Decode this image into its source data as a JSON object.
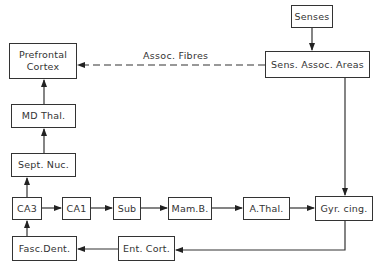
{
  "diagram": {
    "nodes": {
      "senses": "Senses",
      "sens_assoc_areas": "Sens. Assoc. Areas",
      "prefrontal_cortex": "Prefrontal\nCortex",
      "md_thal": "MD Thal.",
      "sept_nuc": "Sept. Nuc.",
      "ca3": "CA3",
      "ca1": "CA1",
      "sub": "Sub",
      "mam_b": "Mam.B.",
      "a_thal": "A.Thal.",
      "gyr_cing": "Gyr. cing.",
      "ent_cort": "Ent. Cort.",
      "fasc_dent": "Fasc.Dent."
    },
    "edge_labels": {
      "assoc_fibres": "Assoc. Fibres"
    },
    "edges": [
      {
        "from": "Senses",
        "to": "Sens. Assoc. Areas",
        "style": "solid"
      },
      {
        "from": "Sens. Assoc. Areas",
        "to": "Prefrontal Cortex",
        "style": "dashed",
        "label": "Assoc. Fibres"
      },
      {
        "from": "Sens. Assoc. Areas",
        "to": "Gyr. cing.",
        "style": "solid"
      },
      {
        "from": "MD Thal.",
        "to": "Prefrontal Cortex",
        "style": "solid"
      },
      {
        "from": "Sept. Nuc.",
        "to": "MD Thal.",
        "style": "solid"
      },
      {
        "from": "CA3",
        "to": "Sept. Nuc.",
        "style": "solid"
      },
      {
        "from": "CA3",
        "to": "CA1",
        "style": "solid"
      },
      {
        "from": "CA1",
        "to": "Sub",
        "style": "solid"
      },
      {
        "from": "Sub",
        "to": "Mam.B.",
        "style": "solid"
      },
      {
        "from": "Mam.B.",
        "to": "A.Thal.",
        "style": "solid"
      },
      {
        "from": "A.Thal.",
        "to": "Gyr. cing.",
        "style": "solid"
      },
      {
        "from": "Gyr. cing.",
        "to": "Ent. Cort.",
        "style": "solid"
      },
      {
        "from": "Ent. Cort.",
        "to": "Fasc.Dent.",
        "style": "solid"
      },
      {
        "from": "Fasc.Dent.",
        "to": "CA3",
        "style": "solid"
      }
    ]
  }
}
